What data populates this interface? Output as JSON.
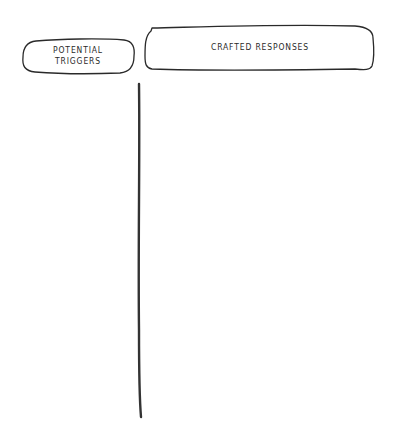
{
  "diagram": {
    "type": "two-column hand-drawn sketch",
    "columns": [
      {
        "header": "POTENTIAL\nTRIGGERS",
        "line1": "POTENTIAL",
        "line2": "TRIGGERS"
      },
      {
        "header": "CRAFTED RESPONSES"
      }
    ],
    "stroke_color": "#2a2a2a",
    "background": "#ffffff"
  }
}
